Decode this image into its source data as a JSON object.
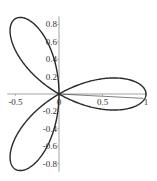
{
  "chart_data": {
    "type": "line",
    "title": "",
    "xlabel": "",
    "ylabel": "",
    "curve": "polar rose r = cos(3θ)",
    "series": [
      {
        "name": "rose",
        "equation": "r = cos(3*theta)",
        "theta_range": [
          0,
          3.14159
        ]
      }
    ],
    "xlim": [
      -0.55,
      1.0
    ],
    "ylim": [
      -0.87,
      0.87
    ],
    "x_ticks": [
      {
        "value": -0.5,
        "label": "-0.5"
      },
      {
        "value": 0,
        "label": "0"
      },
      {
        "value": 0.5,
        "label": "0.5"
      },
      {
        "value": 1,
        "label": "1"
      }
    ],
    "y_ticks": [
      {
        "value": 0.8,
        "label": "0.8"
      },
      {
        "value": 0.6,
        "label": "0.6"
      },
      {
        "value": 0.4,
        "label": "0.4"
      },
      {
        "value": 0.2,
        "label": "0.2"
      },
      {
        "value": -0.2,
        "label": "-0.2"
      },
      {
        "value": -0.4,
        "label": "-0.4"
      },
      {
        "value": -0.6,
        "label": "-0.6"
      },
      {
        "value": -0.8,
        "label": "-0.8"
      }
    ],
    "grid": false,
    "legend": null,
    "annotations": [
      "thin closing segment from origin to approx (0.97, -0.05)"
    ]
  },
  "style": {
    "curve_color": "#2a2a2a",
    "axis_color": "#8a8a8a"
  }
}
